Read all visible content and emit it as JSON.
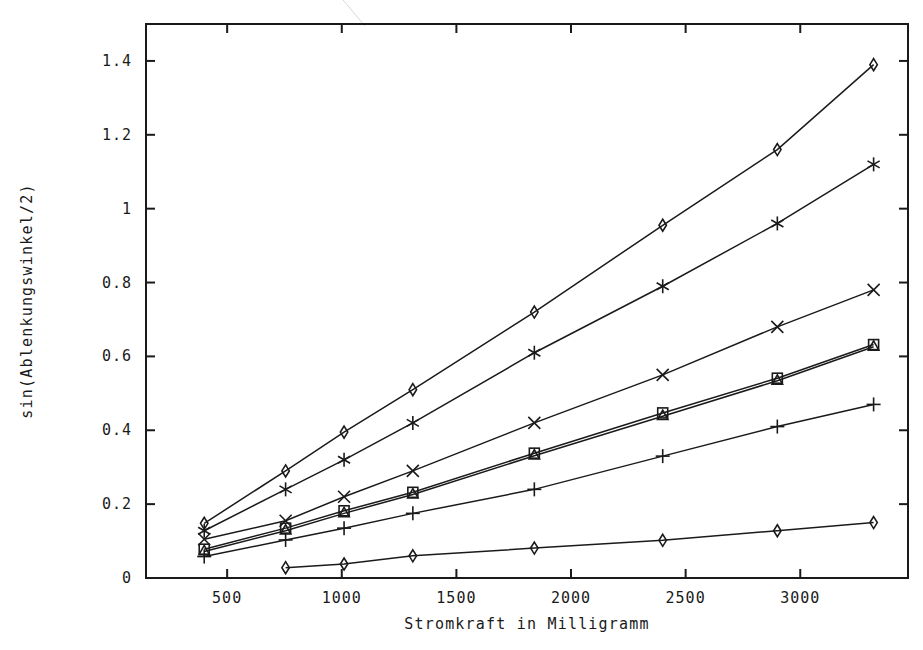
{
  "chart_data": {
    "type": "line",
    "title": "",
    "xlabel": "Stromkraft in Milligramm",
    "ylabel": "sin(Ablenkungswinkel/2)",
    "xlim": [
      146,
      3470
    ],
    "ylim": [
      0,
      1.5
    ],
    "xticks": [
      500,
      1000,
      1500,
      2000,
      2500,
      3000
    ],
    "xtick_labels": [
      "500",
      "1000",
      "1500",
      "2000",
      "2500",
      "3000"
    ],
    "yticks": [
      0,
      0.2,
      0.4,
      0.6,
      0.8,
      1,
      1.2,
      1.4
    ],
    "ytick_labels": [
      "0",
      "0.2",
      "0.4",
      "0.6",
      "0.8",
      "1",
      "1.2",
      "1.4"
    ],
    "grid": false,
    "legend": "none",
    "line_color": "#1a1a1a",
    "background_color": "#ffffff",
    "frame_color": "#1a1a1a",
    "series": [
      {
        "name": "series-1",
        "marker": "diamond",
        "x": [
          400,
          755,
          1010,
          1310,
          1840,
          2400,
          2900,
          3320
        ],
        "values": [
          0.148,
          0.29,
          0.395,
          0.51,
          0.72,
          0.955,
          1.16,
          1.39
        ]
      },
      {
        "name": "series-2",
        "marker": "asterisk",
        "x": [
          400,
          755,
          1010,
          1310,
          1840,
          2400,
          2900,
          3320
        ],
        "values": [
          0.128,
          0.24,
          0.32,
          0.42,
          0.61,
          0.79,
          0.96,
          1.12
        ]
      },
      {
        "name": "series-3",
        "marker": "x",
        "x": [
          400,
          755,
          1010,
          1310,
          1840,
          2400,
          2900,
          3320
        ],
        "values": [
          0.105,
          0.155,
          0.22,
          0.29,
          0.42,
          0.55,
          0.68,
          0.78
        ]
      },
      {
        "name": "series-4",
        "marker": "square",
        "x": [
          400,
          755,
          1010,
          1310,
          1840,
          2400,
          2900,
          3320
        ],
        "values": [
          0.078,
          0.135,
          0.182,
          0.232,
          0.338,
          0.447,
          0.541,
          0.632
        ]
      },
      {
        "name": "series-5",
        "marker": "triangle",
        "x": [
          400,
          755,
          1010,
          1310,
          1840,
          2400,
          2900,
          3320
        ],
        "values": [
          0.072,
          0.128,
          0.175,
          0.226,
          0.331,
          0.438,
          0.534,
          0.626
        ]
      },
      {
        "name": "series-6",
        "marker": "plus",
        "x": [
          400,
          755,
          1010,
          1310,
          1840,
          2400,
          2900,
          3320
        ],
        "values": [
          0.058,
          0.103,
          0.135,
          0.175,
          0.24,
          0.33,
          0.41,
          0.47
        ]
      },
      {
        "name": "series-7",
        "marker": "diamond",
        "x": [
          755,
          1010,
          1310,
          1840,
          2400,
          2900,
          3320
        ],
        "values": [
          0.028,
          0.038,
          0.06,
          0.081,
          0.102,
          0.128,
          0.15
        ]
      }
    ]
  },
  "figure": {
    "ghost_title": "",
    "plot_frame": {
      "left": 146,
      "top": 24,
      "right": 908,
      "bottom": 578
    }
  }
}
